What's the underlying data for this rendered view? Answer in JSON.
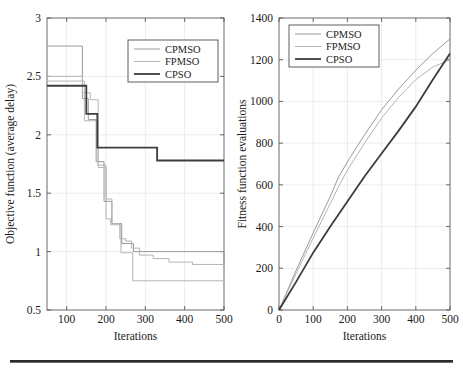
{
  "figure": {
    "background": "#ffffff",
    "axis_color": "#5a5a5a",
    "grid_color": "#e4e4e4",
    "rule_color": "#2b2b2b"
  },
  "series_styles": {
    "CPMSO": {
      "color": "#9a9a9a",
      "width": 1.0
    },
    "FPMSO": {
      "color": "#b4b4b4",
      "width": 1.0
    },
    "CPSO": {
      "color": "#3d3d3d",
      "width": 1.8
    }
  },
  "chart_data": [
    {
      "id": "objective-chart",
      "type": "line",
      "drawstyle": "steps-post",
      "title": "",
      "xlabel": "Iterations",
      "ylabel": "Objective function (average delay)",
      "xlim": [
        50,
        500
      ],
      "ylim": [
        0.5,
        3
      ],
      "xticks": [
        100,
        200,
        300,
        400,
        500
      ],
      "xticklabels": [
        "100",
        "200",
        "300",
        "400",
        "500"
      ],
      "yticks": [
        0.5,
        1,
        1.5,
        2,
        2.5,
        3
      ],
      "yticklabels": [
        "0.5",
        "1",
        "1.5",
        "2",
        "2.5",
        "3"
      ],
      "grid": true,
      "legend": {
        "position": "upper-right",
        "entries": [
          "CPMSO",
          "FPMSO",
          "CPSO"
        ]
      },
      "series": [
        {
          "name": "CPMSO",
          "x": [
            50,
            120,
            140,
            155,
            175,
            195,
            205,
            215,
            240,
            270,
            500
          ],
          "y": [
            2.76,
            2.76,
            2.31,
            2.13,
            1.77,
            1.43,
            1.43,
            1.24,
            1.07,
            1.0,
            0.87
          ]
        },
        {
          "name": "FPMSO",
          "x": [
            50,
            125,
            140,
            160,
            180,
            200,
            215,
            235,
            250,
            265,
            285,
            320,
            360,
            420,
            500
          ],
          "y": [
            2.5,
            2.5,
            2.36,
            2.3,
            1.72,
            1.45,
            1.24,
            1.11,
            1.09,
            1.03,
            0.97,
            0.94,
            0.91,
            0.89,
            0.87
          ]
        },
        {
          "name": "CPSO",
          "x": [
            50,
            130,
            150,
            178,
            330,
            500
          ],
          "y": [
            2.42,
            2.42,
            2.18,
            1.89,
            1.78,
            1.78
          ]
        }
      ],
      "series_low": {
        "name": "FPMSO-lower",
        "x": [
          50,
          125,
          145,
          162,
          180,
          200,
          212,
          238,
          268,
          500
        ],
        "y": [
          2.46,
          2.46,
          2.12,
          2.12,
          1.74,
          1.28,
          1.23,
          0.99,
          0.75,
          0.68
        ]
      }
    },
    {
      "id": "fitness-chart",
      "type": "line",
      "drawstyle": "default",
      "title": "",
      "xlabel": "Iterations",
      "ylabel": "Fitness function evaluations",
      "xlim": [
        0,
        500
      ],
      "ylim": [
        0,
        1400
      ],
      "xticks": [
        0,
        100,
        200,
        300,
        400,
        500
      ],
      "xticklabels": [
        "0",
        "100",
        "200",
        "300",
        "400",
        "500"
      ],
      "yticks": [
        0,
        200,
        400,
        600,
        800,
        1000,
        1200,
        1400
      ],
      "yticklabels": [
        "0",
        "200",
        "400",
        "600",
        "800",
        "1000",
        "1200",
        "1400"
      ],
      "grid": true,
      "legend": {
        "position": "upper-left",
        "entries": [
          "CPMSO",
          "FPMSO",
          "CPSO"
        ]
      },
      "series": [
        {
          "name": "CPMSO",
          "x": [
            0,
            50,
            100,
            150,
            175,
            200,
            250,
            300,
            350,
            400,
            450,
            500
          ],
          "y": [
            0,
            190,
            370,
            545,
            640,
            710,
            840,
            960,
            1060,
            1150,
            1230,
            1300
          ]
        },
        {
          "name": "FPMSO",
          "x": [
            0,
            50,
            100,
            150,
            175,
            200,
            250,
            300,
            350,
            400,
            450,
            500
          ],
          "y": [
            0,
            175,
            345,
            510,
            595,
            670,
            800,
            920,
            1020,
            1105,
            1165,
            1200
          ]
        },
        {
          "name": "CPSO",
          "x": [
            0,
            50,
            100,
            150,
            200,
            250,
            300,
            350,
            400,
            450,
            500
          ],
          "y": [
            0,
            135,
            275,
            400,
            520,
            640,
            750,
            860,
            975,
            1105,
            1230
          ]
        }
      ]
    }
  ]
}
